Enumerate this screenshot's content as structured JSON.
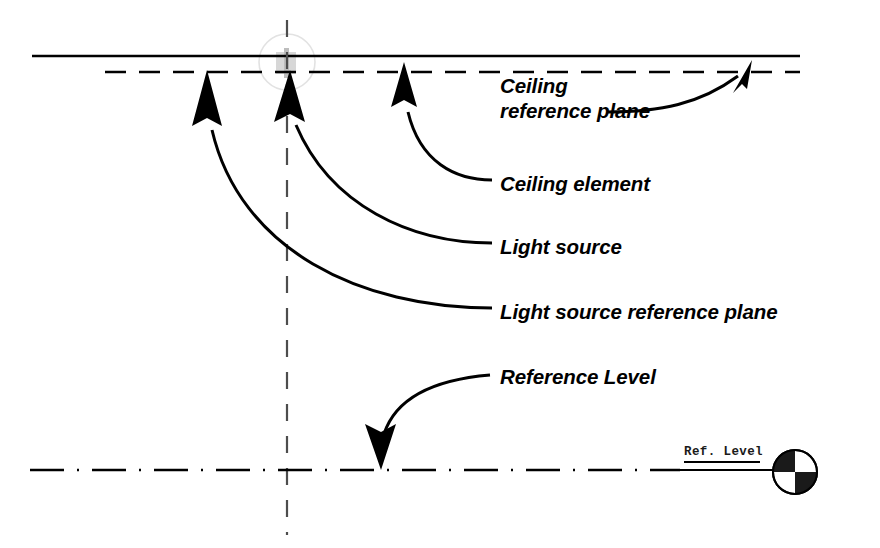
{
  "diagram": {
    "background_color": "#ffffff",
    "ink_color": "#000000",
    "light_source_color": "#d9d9d9",
    "width": 880,
    "height": 548
  },
  "labels": {
    "ceiling_reference_plane_line1": "Ceiling",
    "ceiling_reference_plane_line2": "reference plane",
    "ceiling_element": "Ceiling element",
    "light_source": "Light source",
    "light_source_reference_plane": "Light source reference plane",
    "reference_level": "Reference Level"
  },
  "level_tag": {
    "text": "Ref. Level"
  },
  "geometry": {
    "ceiling_element_line": {
      "x1": 32,
      "y1": 56,
      "x2": 800,
      "y2": 56,
      "style": "solid"
    },
    "ceiling_reference_plane_line": {
      "x1": 105,
      "y1": 72,
      "x2": 800,
      "y2": 72,
      "style": "dashed"
    },
    "light_source_reference_plane_line": {
      "x1": 105,
      "y1": 72,
      "x2": 800,
      "y2": 72,
      "style": "dashed"
    },
    "reference_level_line": {
      "x1": 30,
      "y1": 470,
      "x2": 680,
      "y2": 470,
      "style": "dash-dot"
    },
    "vertical_axis": {
      "x1": 287,
      "y1": 20,
      "x2": 287,
      "y2": 535,
      "style": "dashed"
    },
    "light_source_symbol": {
      "cx": 287,
      "cy": 62,
      "r": 28
    },
    "level_marker_circle": {
      "cx": 795,
      "cy": 472,
      "r": 22
    }
  }
}
